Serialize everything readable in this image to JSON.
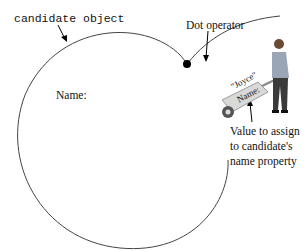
{
  "diagram": {
    "object_label": "candidate object",
    "dot_label": "Dot operator",
    "property_label": "Name:",
    "value_string": "\"Joyce\"",
    "wheelbarrow_label": "Name:",
    "value_caption_lines": [
      "Value to assign",
      "to candidate's",
      "name property"
    ]
  },
  "colors": {
    "line": "#333333",
    "dot": "#000000",
    "background": "#ffffff"
  }
}
